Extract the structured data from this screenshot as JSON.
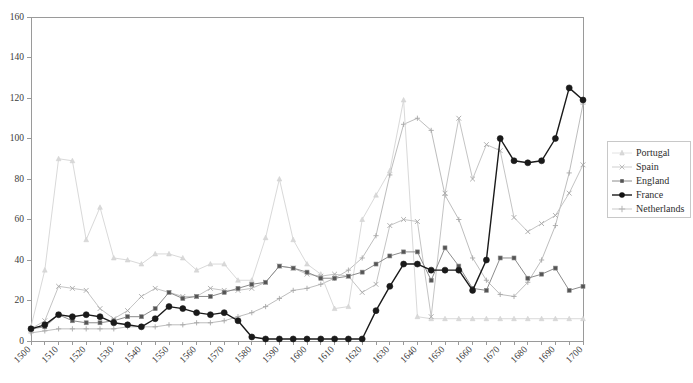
{
  "chart_data": {
    "type": "line",
    "title": "",
    "xlabel": "",
    "ylabel": "",
    "xlim": [
      1500,
      1700
    ],
    "ylim": [
      0,
      160
    ],
    "ytick_step": 20,
    "xtick_step": 10,
    "grid": false,
    "legend_position": "right",
    "x": [
      1500,
      1505,
      1510,
      1515,
      1520,
      1525,
      1530,
      1535,
      1540,
      1545,
      1550,
      1555,
      1560,
      1565,
      1570,
      1575,
      1580,
      1585,
      1590,
      1595,
      1600,
      1605,
      1610,
      1615,
      1620,
      1625,
      1630,
      1635,
      1640,
      1645,
      1650,
      1655,
      1660,
      1665,
      1670,
      1675,
      1680,
      1685,
      1690,
      1695,
      1700
    ],
    "xticks": [
      1500,
      1510,
      1520,
      1530,
      1540,
      1550,
      1560,
      1570,
      1580,
      1590,
      1600,
      1610,
      1620,
      1630,
      1640,
      1650,
      1660,
      1670,
      1680,
      1690,
      1700
    ],
    "yticks": [
      0,
      20,
      40,
      60,
      80,
      100,
      120,
      140,
      160
    ],
    "series": [
      {
        "name": "Portugal",
        "color": "#d9d9d9",
        "marker": "triangle",
        "width": 1,
        "values": [
          7,
          35,
          90,
          89,
          50,
          66,
          41,
          40,
          38,
          43,
          43,
          41,
          35,
          38,
          38,
          30,
          30,
          51,
          80,
          50,
          38,
          33,
          16,
          17,
          60,
          72,
          84,
          119,
          12,
          11,
          11,
          11,
          11,
          11,
          11,
          11,
          11,
          11,
          11,
          11,
          11
        ]
      },
      {
        "name": "Spain",
        "color": "#c4c4c4",
        "marker": "cross-light",
        "width": 1,
        "values": [
          6,
          10,
          27,
          26,
          25,
          16,
          11,
          15,
          22,
          26,
          24,
          22,
          22,
          26,
          25,
          25,
          26,
          29,
          37,
          36,
          33,
          32,
          33,
          32,
          24,
          28,
          57,
          60,
          59,
          12,
          73,
          110,
          80,
          97,
          94,
          61,
          54,
          58,
          62,
          73,
          87
        ]
      },
      {
        "name": "England",
        "color": "#8c8c8c",
        "marker": "square",
        "width": 1,
        "values": [
          6,
          7,
          13,
          10,
          9,
          9,
          10,
          12,
          12,
          16,
          24,
          21,
          22,
          22,
          24,
          26,
          28,
          29,
          37,
          36,
          34,
          31,
          31,
          32,
          34,
          38,
          42,
          44,
          44,
          30,
          46,
          37,
          26,
          25,
          41,
          41,
          31,
          33,
          36,
          25,
          27
        ]
      },
      {
        "name": "France",
        "color": "#1a1a1a",
        "marker": "disc",
        "width": 1.4,
        "values": [
          6,
          8,
          13,
          12,
          13,
          12,
          9,
          8,
          7,
          11,
          17,
          16,
          14,
          13,
          14,
          10,
          2,
          1,
          1,
          1,
          1,
          1,
          1,
          1,
          1,
          15,
          27,
          38,
          38,
          35,
          35,
          35,
          25,
          40,
          100,
          89,
          88,
          89,
          100,
          125,
          119
        ]
      },
      {
        "name": "Netherlands",
        "color": "#b5b5b5",
        "marker": "plus",
        "width": 1,
        "values": [
          4,
          5,
          5,
          5,
          5,
          5,
          5,
          5,
          5,
          5,
          5,
          5,
          5,
          5,
          5,
          5,
          5,
          5,
          5,
          5,
          5,
          5,
          5,
          5,
          5,
          5,
          5,
          5,
          5,
          5,
          5,
          5,
          5,
          5,
          5,
          5,
          5,
          5,
          5,
          5,
          5
        ]
      }
    ],
    "netherlands_values": [
      4,
      5,
      5,
      5,
      5,
      5,
      5,
      5,
      5,
      5,
      5,
      5,
      5,
      5,
      5,
      5,
      5,
      5,
      5,
      5,
      5,
      5,
      5,
      5,
      5,
      5,
      5,
      5,
      5,
      5,
      5,
      5,
      5,
      5,
      5,
      5,
      5,
      5,
      5,
      5,
      5
    ]
  },
  "legend": {
    "items": [
      {
        "label": "Portugal",
        "color": "#d9d9d9",
        "marker": "triangle"
      },
      {
        "label": "Spain",
        "color": "#c4c4c4",
        "marker": "cross-light"
      },
      {
        "label": "England",
        "color": "#8c8c8c",
        "marker": "square"
      },
      {
        "label": "France",
        "color": "#1a1a1a",
        "marker": "disc"
      },
      {
        "label": "Netherlands",
        "color": "#b5b5b5",
        "marker": "plus"
      }
    ]
  },
  "netherlands_series": {
    "name": "Netherlands",
    "color": "#bdbdbd",
    "values": [
      4,
      5,
      6,
      6,
      6,
      6,
      6,
      7,
      7,
      7,
      8,
      8,
      9,
      9,
      10,
      12,
      14,
      17,
      21,
      25,
      26,
      28,
      31,
      35,
      41,
      52,
      82,
      107,
      110,
      104,
      72,
      60,
      41,
      30,
      23,
      22,
      29,
      40,
      57,
      83,
      117
    ]
  }
}
